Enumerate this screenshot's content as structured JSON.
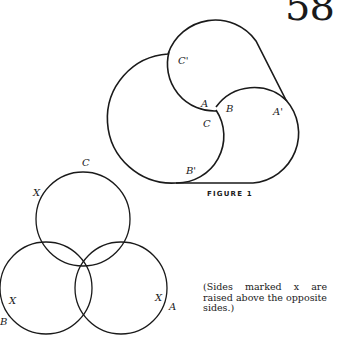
{
  "page_number": "58",
  "figure1": {
    "caption": "FIGURE 1",
    "labels": {
      "A": "A",
      "B": "B",
      "C": "C",
      "A_prime": "A'",
      "B_prime": "B'",
      "C_prime": "C'"
    }
  },
  "figure2": {
    "labels": {
      "C": "C",
      "B": "B",
      "A": "A",
      "x_top": "X",
      "x_left": "X",
      "x_right": "X"
    }
  },
  "note": "(Sides marked x are raised above the opposite sides.)"
}
